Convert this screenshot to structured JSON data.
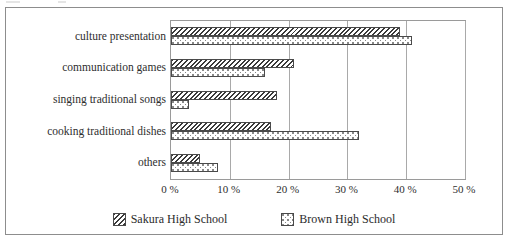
{
  "chart_data": {
    "type": "bar",
    "orientation": "horizontal",
    "title": "",
    "xlabel": "",
    "ylabel": "",
    "xlim": [
      0,
      50
    ],
    "grid": true,
    "legend_position": "bottom",
    "categories": [
      "culture presentation",
      "communication games",
      "singing traditional songs",
      "cooking traditional dishes",
      "others"
    ],
    "x_ticks": [
      0,
      10,
      20,
      30,
      40,
      50
    ],
    "x_tick_labels": [
      "0 %",
      "10 %",
      "20 %",
      "30 %",
      "40 %",
      "50 %"
    ],
    "series": [
      {
        "name": "Sakura High School",
        "pattern": "diagonal-hatch",
        "values": [
          39,
          21,
          18,
          17,
          5
        ]
      },
      {
        "name": "Brown High School",
        "pattern": "dotted-stipple",
        "values": [
          41,
          16,
          3,
          32,
          8
        ]
      }
    ]
  },
  "legend": {
    "items": [
      {
        "label": "Sakura High School",
        "swatch": "hatch-swatch-icon"
      },
      {
        "label": "Brown High School",
        "swatch": "dots-swatch-icon"
      }
    ]
  },
  "colors": {
    "frame": "#8d8d8d",
    "axis": "#9a9a9a",
    "gridline": "#a9a9a9",
    "bar_outline": "#4a4a4a",
    "hatch": "#3a3a3a",
    "stipple": "#8a8a8a",
    "text": "#2b2b2b",
    "background": "#ffffff"
  }
}
